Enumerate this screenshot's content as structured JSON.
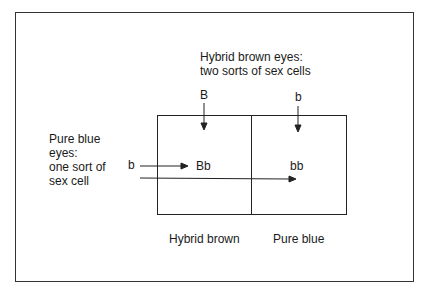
{
  "diagram": {
    "type": "punnett-square",
    "top_parent": {
      "label_line1": "Hybrid brown eyes:",
      "label_line2": "two sorts of sex cells",
      "gametes": [
        "B",
        "b"
      ]
    },
    "left_parent": {
      "label_lines": [
        "Pure blue",
        "eyes:",
        "one sort of",
        "sex cell"
      ],
      "gamete": "b"
    },
    "cells": [
      "Bb",
      "bb"
    ],
    "column_results": [
      "Hybrid brown",
      "Pure blue"
    ],
    "colors": {
      "line": "#222222",
      "background": "#ffffff",
      "text": "#1a1a1a"
    }
  }
}
